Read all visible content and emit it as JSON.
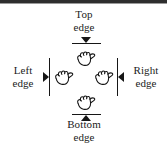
{
  "figure": {
    "background_color": "#ffffff",
    "ink_color": "#161616",
    "rule_color": "#2e2e2e"
  },
  "labels": {
    "top": "Top\nedge",
    "top_line1": "Top",
    "top_line2": "edge",
    "bottom_line1": "Bottom",
    "bottom_line2": "edge",
    "left_line1": "Left",
    "left_line2": "edge",
    "right_line1": "Right",
    "right_line2": "edge"
  },
  "markers": {
    "top": {
      "icon": "arrow-down-icon",
      "edge_icon": "horizontal-rule-icon"
    },
    "bottom": {
      "icon": "arrow-up-icon",
      "edge_icon": "horizontal-rule-icon"
    },
    "left": {
      "icon": "arrow-right-icon",
      "edge_icon": "vertical-rule-icon"
    },
    "right": {
      "icon": "arrow-left-icon",
      "edge_icon": "vertical-rule-icon"
    }
  },
  "cursors": {
    "top": "grab-hand-icon",
    "bottom": "grab-hand-icon",
    "left": "grab-hand-icon",
    "right": "grab-hand-icon"
  }
}
